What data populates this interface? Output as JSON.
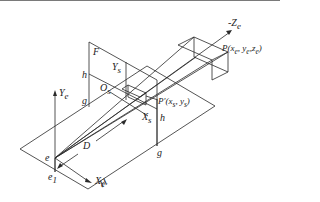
{
  "diagram": {
    "type": "perspective-projection",
    "labels": {
      "neg_ze": "-Z",
      "neg_ze_sub": "e",
      "point_p": "P(x",
      "point_p_full": "P(xe, ye,ze)",
      "point_p_prime_full": "P′(xs, ys)",
      "plane_f": "F",
      "ys_axis": "Y",
      "ys_sub": "s",
      "os_origin": "O",
      "os_sub": "s",
      "xs_axis": "X",
      "xs_sub": "s",
      "h_top": "h",
      "g_left": "g",
      "h_right": "h",
      "g_right": "g",
      "ye_axis": "Y",
      "ye_sub": "e",
      "eye": "e",
      "distance": "D",
      "xe_axis": "X",
      "xe_sub": "e",
      "e1": "e",
      "e1_sub": "1",
      "ground_plane": "H"
    },
    "text": {
      "p": "P(x",
      "p_sub1": "e",
      "p_mid1": ", y",
      "p_sub2": "e",
      "p_mid2": ",z",
      "p_sub3": "e",
      "p_end": ")",
      "pp": "P′(x",
      "pp_sub1": "s",
      "pp_mid": ", y",
      "pp_sub2": "s",
      "pp_end": ")"
    },
    "colors": {
      "line": "#2a2a2a",
      "background": "#ffffff"
    }
  }
}
